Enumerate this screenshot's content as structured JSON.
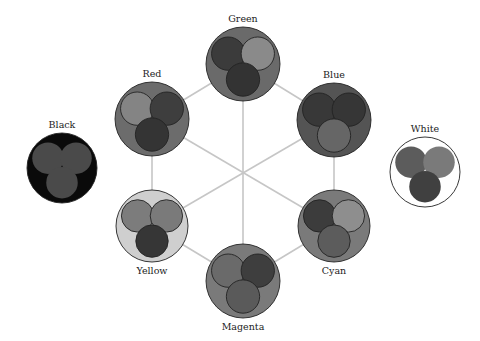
{
  "nodes": [
    {
      "id": "green",
      "label": "Green",
      "label_pos": "above",
      "outer": "#6a6a6a",
      "inner": [
        "#3b3b3b",
        "#8a8a8a",
        "#333333"
      ]
    },
    {
      "id": "red",
      "label": "Red",
      "label_pos": "above",
      "outer": "#6c6c6c",
      "inner": [
        "#848484",
        "#3e3e3e",
        "#343434"
      ]
    },
    {
      "id": "blue",
      "label": "Blue",
      "label_pos": "above",
      "outer": "#545454",
      "inner": [
        "#383838",
        "#363636",
        "#666666"
      ]
    },
    {
      "id": "yellow",
      "label": "Yellow",
      "label_pos": "below",
      "outer": "#cfcfcf",
      "inner": [
        "#7c7c7c",
        "#7a7a7a",
        "#363636"
      ]
    },
    {
      "id": "cyan",
      "label": "Cyan",
      "label_pos": "below",
      "outer": "#7a7a7a",
      "inner": [
        "#3c3c3c",
        "#8e8e8e",
        "#5c5c5c"
      ]
    },
    {
      "id": "magenta",
      "label": "Magenta",
      "label_pos": "below",
      "outer": "#7a7a7a",
      "inner": [
        "#6a6a6a",
        "#3e3e3e",
        "#5a5a5a"
      ]
    },
    {
      "id": "black",
      "label": "Black",
      "label_pos": "above",
      "outer": "#0a0a0a",
      "inner": [
        "#4a4a4a",
        "#4a4a4a",
        "#4a4a4a"
      ],
      "inner_stroke": false
    },
    {
      "id": "white",
      "label": "White",
      "label_pos": "above",
      "outer": "#ffffff",
      "inner": [
        "#5c5c5c",
        "#7a7a7a",
        "#404040"
      ],
      "inner_stroke": false
    }
  ],
  "edges": [
    [
      "green",
      "red"
    ],
    [
      "green",
      "blue"
    ],
    [
      "red",
      "yellow"
    ],
    [
      "blue",
      "cyan"
    ],
    [
      "yellow",
      "magenta"
    ],
    [
      "cyan",
      "magenta"
    ],
    [
      "green",
      "magenta"
    ],
    [
      "red",
      "cyan"
    ],
    [
      "blue",
      "yellow"
    ]
  ],
  "colors": {
    "edge": "#c6c6c6",
    "outline": "#222222"
  }
}
